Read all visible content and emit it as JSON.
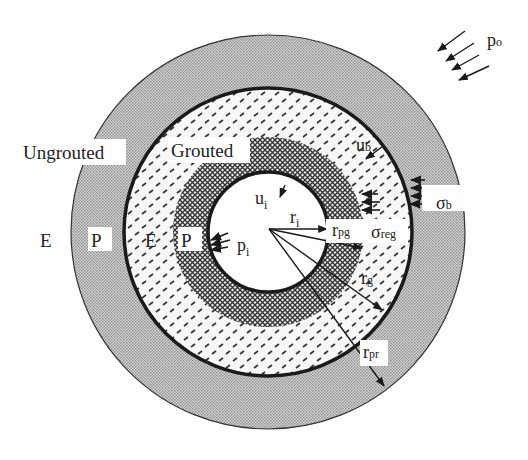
{
  "diagram": {
    "geometry": {
      "center": [
        268,
        232
      ],
      "r_outer_ungrouted": 197,
      "r_grout_boundary": 144,
      "r_plastic_grout": 95,
      "r_opening": 60
    },
    "colors": {
      "ungrouted_fill": "#b9b9b9",
      "grouted_fill": "#f2f2f2",
      "plastic_grout_fill": "#8a8a8a",
      "opening_fill": "#ffffff",
      "line": "#1a1a1a",
      "label_bg": "#ffffff"
    },
    "zones": {
      "ungrouted": "Ungrouted",
      "grouted": "Grouted"
    },
    "zone_markers": {
      "e_outer": "E",
      "p_outer": "P",
      "e_inner": "E",
      "p_inner": "P"
    },
    "symbols": {
      "p_o": {
        "base": "p",
        "sub": "o"
      },
      "u_b": {
        "base": "u",
        "sub": "b"
      },
      "sigma_b": {
        "base": "σ",
        "sub": "b"
      },
      "u_i": {
        "base": "u",
        "sub": "i"
      },
      "r_i": {
        "base": "r",
        "sub": "i"
      },
      "r_pg": {
        "base": "r",
        "sub": "pg"
      },
      "sigma_reg": {
        "base": "σ",
        "sub": "reg"
      },
      "p_i": {
        "base": "p",
        "sub": "i"
      },
      "r_g": {
        "base": "r",
        "sub": "g"
      },
      "r_pr": {
        "base": "r",
        "sub": "pr"
      }
    }
  }
}
